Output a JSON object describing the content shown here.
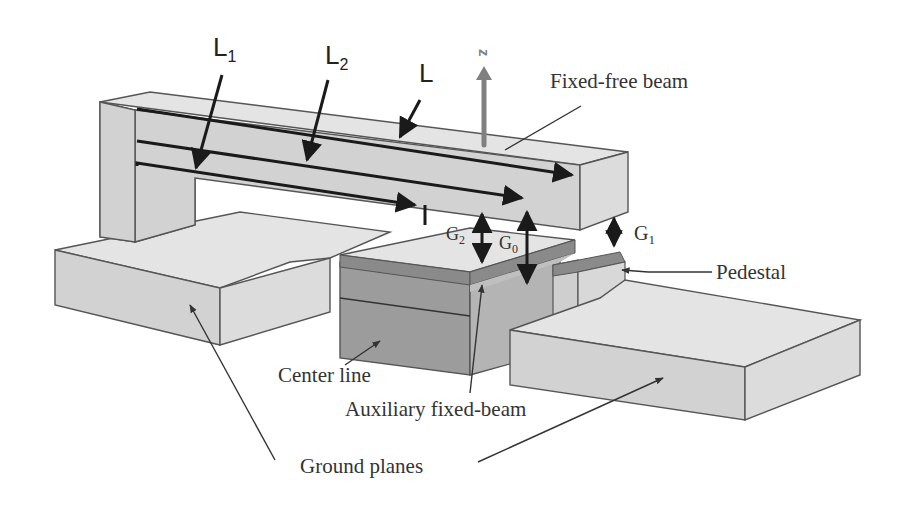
{
  "figure": {
    "type": "MEMS switch schematic",
    "labels": {
      "L1_main": "L",
      "L1_sub": "1",
      "L2_main": "L",
      "L2_sub": "2",
      "L": "L",
      "z_axis": "z",
      "fixed_free_beam": "Fixed-free beam",
      "G1_main": "G",
      "G1_sub": "1",
      "G2_main": "G",
      "G2_sub": "2",
      "G0_main": "G",
      "G0_sub": "0",
      "pedestal": "Pedestal",
      "center_line": "Center line",
      "auxiliary_fixed_beam": "Auxiliary fixed-beam",
      "ground_planes": "Ground planes"
    },
    "colors": {
      "structure_light": "#dcdcdc",
      "structure_dark": "#9c9c9c",
      "axis_arrow": "#808080",
      "dimension_lines": "#1a1a1a"
    }
  }
}
